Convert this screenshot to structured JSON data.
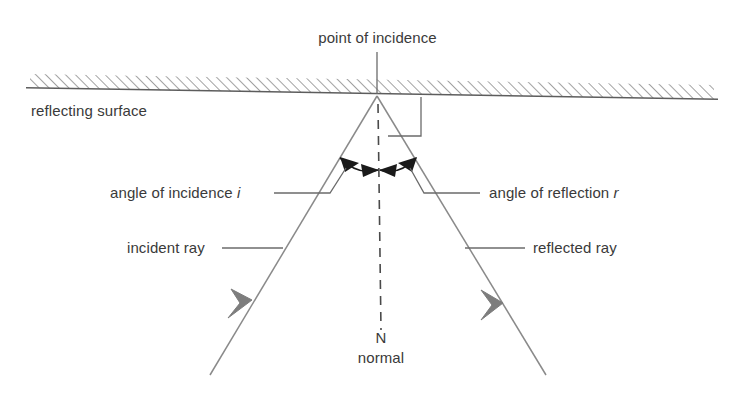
{
  "diagram": {
    "labels": {
      "point_of_incidence": "point of incidence",
      "reflecting_surface": "reflecting surface",
      "angle_of_incidence": "angle of incidence ",
      "angle_of_incidence_symbol": "i",
      "angle_of_reflection": "angle of reflection ",
      "angle_of_reflection_symbol": "r",
      "incident_ray": "incident ray",
      "reflected_ray": "reflected ray",
      "normal_symbol": "N",
      "normal_word": "normal"
    },
    "colors": {
      "line": "#6b6b6b",
      "text": "#3a3a3a",
      "arrow_fill": "#777777",
      "angle_arrow": "#1a1a1a",
      "background": "#ffffff",
      "hatch": "#8a8a8a"
    },
    "geometry": {
      "point_of_incidence": [
        377,
        96
      ],
      "surface_left": [
        30,
        88
      ],
      "surface_right": [
        714,
        99
      ],
      "incident_ray_start": [
        210,
        375
      ],
      "reflected_ray_end": [
        546,
        375
      ],
      "normal_bottom": [
        381,
        327
      ],
      "right_angle_marker": [
        421,
        96,
        421,
        136,
        388,
        136
      ]
    }
  }
}
